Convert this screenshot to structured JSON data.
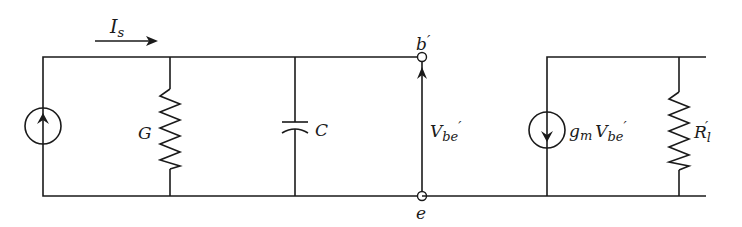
{
  "diagram": {
    "type": "small-signal equivalent circuit",
    "labels": {
      "source_current": "I",
      "source_current_sub": "s",
      "conductance": "G",
      "capacitance": "C",
      "node_top": "b",
      "node_top_prime": "′",
      "node_bottom": "e",
      "voltage": "V",
      "voltage_sub": "be",
      "voltage_prime": "′",
      "dep_source_gm": "g",
      "dep_source_gm_sub": "m",
      "dep_source_v": "V",
      "dep_source_v_sub": "be",
      "dep_source_prime": "′",
      "load": "R",
      "load_sub": "l",
      "load_prime": "′"
    },
    "components": [
      {
        "id": "Is",
        "kind": "current-source",
        "direction": "up"
      },
      {
        "id": "G",
        "kind": "resistor"
      },
      {
        "id": "C",
        "kind": "capacitor"
      },
      {
        "id": "Vbe'",
        "kind": "port-voltage",
        "nodes": [
          "b'",
          "e"
        ]
      },
      {
        "id": "gmVbe'",
        "kind": "dependent-current-source",
        "direction": "down"
      },
      {
        "id": "Rl'",
        "kind": "resistor"
      }
    ],
    "colors": {
      "line": "#1a1a1a",
      "background": "#ffffff"
    }
  }
}
